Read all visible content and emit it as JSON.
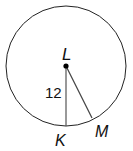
{
  "diagram": {
    "type": "circle-geometry",
    "center": {
      "label": "L",
      "x": 66,
      "y": 66
    },
    "radius_px": 60,
    "points": [
      {
        "label": "K",
        "x": 66,
        "y": 126
      },
      {
        "label": "M",
        "x": 92,
        "y": 118
      }
    ],
    "segments": [
      {
        "from": "L",
        "to": "K",
        "length_label": "12"
      },
      {
        "from": "L",
        "to": "M"
      }
    ],
    "labels": {
      "center": "L",
      "k": "K",
      "m": "M",
      "radius_value": "12"
    },
    "colors": {
      "stroke": "#222222",
      "segment": "#555555",
      "background": "#ffffff"
    }
  }
}
